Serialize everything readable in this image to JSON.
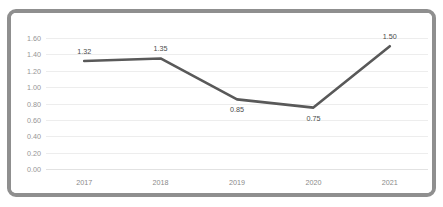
{
  "frame": {
    "border_color": "#8f8f8f",
    "background": "#ffffff"
  },
  "top_remnant_text": "",
  "chart_data": {
    "type": "line",
    "title": "",
    "subtitle": "",
    "xlabel": "",
    "ylabel": "",
    "categories": [
      "2017",
      "2018",
      "2019",
      "2020",
      "2021"
    ],
    "values": [
      1.32,
      1.35,
      0.85,
      0.75,
      1.5
    ],
    "data_labels": [
      "1.32",
      "1.35",
      "0.85",
      "0.75",
      "1.50"
    ],
    "data_label_positions": [
      "above",
      "above",
      "below",
      "below",
      "above"
    ],
    "ylim": [
      0.0,
      1.6
    ],
    "ytick_step": 0.2,
    "ytick_labels": [
      "0.00",
      "0.20",
      "0.40",
      "0.60",
      "0.80",
      "1.00",
      "1.20",
      "1.40",
      "1.60"
    ],
    "xtick_labels": [
      "2017",
      "2018",
      "2019",
      "2020",
      "2021"
    ],
    "grid": "horizontal",
    "legend": "none",
    "markers": "none",
    "series": [
      {
        "name": "",
        "values": [
          1.32,
          1.35,
          0.85,
          0.75,
          1.5
        ],
        "color": "#595959",
        "line_width": 2.6
      }
    ],
    "colors": {
      "line": "#595959",
      "gridline": "#ededed",
      "axis_text": "#8a8a8a",
      "data_label_text": "#4a4a4a",
      "plot_background": "#ffffff"
    }
  }
}
